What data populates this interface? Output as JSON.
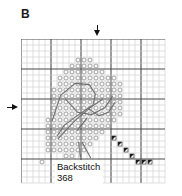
{
  "panel": {
    "letter": "B"
  },
  "legend": {
    "title": "Backstitch",
    "floss_code": "368"
  },
  "markers": {
    "top_arrow": "down-arrow-marker",
    "left_arrow": "right-arrow-marker"
  },
  "chart_data": {
    "type": "heatmap",
    "title": "B",
    "xlabel": "",
    "ylabel": "",
    "grid": {
      "columns": 24,
      "rows": 24,
      "cell_px": 6,
      "heavy_line_every": 5,
      "grid_on": true,
      "center_column": 12,
      "center_row": 11
    },
    "legend_entries": [
      {
        "symbol": "open-circle",
        "name": "cross stitch"
      },
      {
        "symbol": "half-triangle",
        "name": "three-quarter stitch"
      },
      {
        "symbol": "line",
        "name": "Backstitch",
        "floss": "368"
      }
    ],
    "symbol_cells": {
      "open_circle": [
        [
          9,
          3
        ],
        [
          10,
          3
        ],
        [
          11,
          3
        ],
        [
          8,
          4
        ],
        [
          9,
          4
        ],
        [
          10,
          4
        ],
        [
          11,
          4
        ],
        [
          12,
          4
        ],
        [
          7,
          5
        ],
        [
          8,
          5
        ],
        [
          9,
          5
        ],
        [
          10,
          5
        ],
        [
          11,
          5
        ],
        [
          12,
          5
        ],
        [
          13,
          5
        ],
        [
          6,
          6
        ],
        [
          7,
          6
        ],
        [
          8,
          6
        ],
        [
          9,
          6
        ],
        [
          10,
          6
        ],
        [
          11,
          6
        ],
        [
          12,
          6
        ],
        [
          13,
          6
        ],
        [
          14,
          6
        ],
        [
          15,
          6
        ],
        [
          6,
          7
        ],
        [
          7,
          7
        ],
        [
          8,
          7
        ],
        [
          9,
          7
        ],
        [
          10,
          7
        ],
        [
          11,
          7
        ],
        [
          12,
          7
        ],
        [
          13,
          7
        ],
        [
          14,
          7
        ],
        [
          15,
          7
        ],
        [
          16,
          7
        ],
        [
          5,
          8
        ],
        [
          6,
          8
        ],
        [
          7,
          8
        ],
        [
          8,
          8
        ],
        [
          9,
          8
        ],
        [
          10,
          8
        ],
        [
          11,
          8
        ],
        [
          12,
          8
        ],
        [
          13,
          8
        ],
        [
          14,
          8
        ],
        [
          15,
          8
        ],
        [
          16,
          8
        ],
        [
          5,
          9
        ],
        [
          6,
          9
        ],
        [
          7,
          9
        ],
        [
          8,
          9
        ],
        [
          9,
          9
        ],
        [
          10,
          9
        ],
        [
          11,
          9
        ],
        [
          12,
          9
        ],
        [
          13,
          9
        ],
        [
          14,
          9
        ],
        [
          15,
          9
        ],
        [
          16,
          9
        ],
        [
          5,
          10
        ],
        [
          6,
          10
        ],
        [
          7,
          10
        ],
        [
          8,
          10
        ],
        [
          9,
          10
        ],
        [
          10,
          10
        ],
        [
          11,
          10
        ],
        [
          12,
          10
        ],
        [
          13,
          10
        ],
        [
          14,
          10
        ],
        [
          15,
          10
        ],
        [
          16,
          10
        ],
        [
          5,
          11
        ],
        [
          6,
          11
        ],
        [
          7,
          11
        ],
        [
          8,
          11
        ],
        [
          9,
          11
        ],
        [
          10,
          11
        ],
        [
          11,
          11
        ],
        [
          12,
          11
        ],
        [
          13,
          11
        ],
        [
          14,
          11
        ],
        [
          15,
          11
        ],
        [
          16,
          11
        ],
        [
          5,
          12
        ],
        [
          6,
          12
        ],
        [
          7,
          12
        ],
        [
          8,
          12
        ],
        [
          9,
          12
        ],
        [
          10,
          12
        ],
        [
          11,
          12
        ],
        [
          12,
          12
        ],
        [
          13,
          12
        ],
        [
          14,
          12
        ],
        [
          15,
          12
        ],
        [
          16,
          12
        ],
        [
          4,
          13
        ],
        [
          5,
          13
        ],
        [
          6,
          13
        ],
        [
          7,
          13
        ],
        [
          8,
          13
        ],
        [
          9,
          13
        ],
        [
          10,
          13
        ],
        [
          11,
          13
        ],
        [
          12,
          13
        ],
        [
          13,
          13
        ],
        [
          14,
          13
        ],
        [
          15,
          13
        ],
        [
          4,
          14
        ],
        [
          5,
          14
        ],
        [
          6,
          14
        ],
        [
          7,
          14
        ],
        [
          8,
          14
        ],
        [
          9,
          14
        ],
        [
          10,
          14
        ],
        [
          11,
          14
        ],
        [
          12,
          14
        ],
        [
          13,
          14
        ],
        [
          14,
          14
        ],
        [
          4,
          15
        ],
        [
          5,
          15
        ],
        [
          6,
          15
        ],
        [
          7,
          15
        ],
        [
          8,
          15
        ],
        [
          9,
          15
        ],
        [
          10,
          15
        ],
        [
          11,
          15
        ],
        [
          12,
          15
        ],
        [
          13,
          15
        ],
        [
          4,
          16
        ],
        [
          5,
          16
        ],
        [
          6,
          16
        ],
        [
          7,
          16
        ],
        [
          8,
          16
        ],
        [
          9,
          16
        ],
        [
          10,
          16
        ],
        [
          11,
          16
        ],
        [
          12,
          16
        ],
        [
          4,
          17
        ],
        [
          5,
          17
        ],
        [
          6,
          17
        ],
        [
          7,
          17
        ],
        [
          8,
          17
        ],
        [
          9,
          17
        ],
        [
          10,
          17
        ],
        [
          11,
          17
        ],
        [
          4,
          18
        ],
        [
          5,
          18
        ],
        [
          6,
          18
        ],
        [
          7,
          18
        ],
        [
          8,
          18
        ],
        [
          9,
          18
        ],
        [
          10,
          18
        ],
        [
          3,
          20
        ],
        [
          7,
          19
        ],
        [
          8,
          19
        ]
      ],
      "dark_triangle": [
        [
          15,
          16
        ],
        [
          16,
          17
        ],
        [
          17,
          18
        ],
        [
          18,
          19
        ],
        [
          19,
          20
        ],
        [
          20,
          20
        ],
        [
          21,
          20
        ]
      ]
    },
    "backstitch_paths": [
      [
        [
          5.2,
          13.6
        ],
        [
          6.6,
          9.4
        ],
        [
          9.0,
          7.4
        ],
        [
          11.4,
          7.6
        ],
        [
          12.4,
          9.2
        ],
        [
          12.0,
          11.0
        ],
        [
          9.6,
          12.6
        ],
        [
          7.2,
          14.4
        ],
        [
          6.0,
          16.2
        ]
      ],
      [
        [
          7.4,
          10.0
        ],
        [
          9.4,
          12.2
        ],
        [
          11.8,
          12.6
        ],
        [
          14.0,
          11.4
        ],
        [
          15.2,
          9.6
        ]
      ],
      [
        [
          6.2,
          16.6
        ],
        [
          9.0,
          13.6
        ],
        [
          11.6,
          11.4
        ],
        [
          13.6,
          10.0
        ]
      ],
      [
        [
          11.2,
          11.6
        ],
        [
          13.0,
          12.8
        ],
        [
          14.6,
          12.2
        ],
        [
          15.6,
          10.6
        ]
      ],
      [
        [
          9.4,
          15.2
        ],
        [
          11.0,
          13.2
        ]
      ],
      [
        [
          9.6,
          17.2
        ],
        [
          9.9,
          19.6
        ]
      ],
      [
        [
          10.2,
          17.2
        ],
        [
          11.6,
          19.8
        ]
      ]
    ],
    "leader_line": [
      [
        9.8,
        17.4
      ],
      [
        9.6,
        20.4
      ]
    ]
  }
}
